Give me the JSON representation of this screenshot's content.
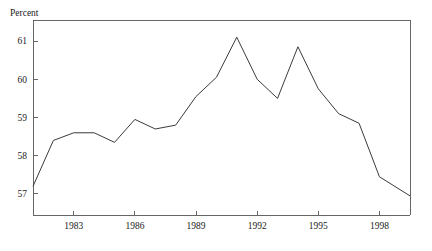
{
  "chart_data": {
    "type": "line",
    "title": "",
    "subtitle": "",
    "ylabel": "Percent",
    "xlabel": "",
    "grid": false,
    "legend": false,
    "legend_position": "none",
    "xlim": [
      1981.0,
      1999.5
    ],
    "ylim": [
      56.45,
      61.55
    ],
    "ytick_labels": [
      "57",
      "58",
      "59",
      "60",
      "61"
    ],
    "ytick_values": [
      57,
      58,
      59,
      60,
      61
    ],
    "xtick_labels": [
      "1983",
      "1986",
      "1989",
      "1992",
      "1995",
      "1998"
    ],
    "xtick_values": [
      1983,
      1986,
      1989,
      1992,
      1995,
      1998
    ],
    "line_color": "#3a3a3a",
    "axis_color": "#555555",
    "background": "#ffffff",
    "x": [
      1981.0,
      1982.0,
      1983.0,
      1984.0,
      1985.0,
      1986.0,
      1987.0,
      1988.0,
      1989.0,
      1990.0,
      1991.0,
      1992.0,
      1993.0,
      1994.0,
      1995.0,
      1996.0,
      1997.0,
      1998.0,
      1999.5
    ],
    "values": [
      57.2,
      58.4,
      58.6,
      58.6,
      58.35,
      58.95,
      58.7,
      58.8,
      59.55,
      60.05,
      61.1,
      60.0,
      59.5,
      60.85,
      59.75,
      59.1,
      58.85,
      57.45,
      56.95
    ],
    "series": [
      {
        "name": "Percent",
        "values": [
          57.2,
          58.4,
          58.6,
          58.6,
          58.35,
          58.95,
          58.7,
          58.8,
          59.55,
          60.05,
          61.1,
          60.0,
          59.5,
          60.85,
          59.75,
          59.1,
          58.85,
          57.45,
          56.95
        ]
      }
    ]
  },
  "axes": {
    "ylabel": "Percent"
  },
  "layout": {
    "plot_left": 33,
    "plot_right": 410,
    "plot_top": 20,
    "plot_bottom": 215
  }
}
